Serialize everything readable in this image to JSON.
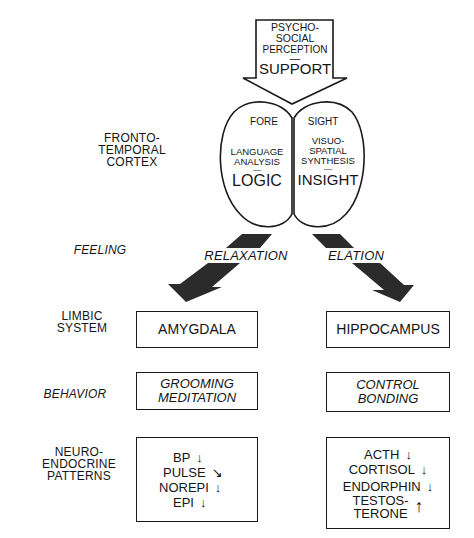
{
  "input_arrow": {
    "lines": [
      "PSYCHO-",
      "SOCIAL",
      "PERCEPTION",
      "—",
      "SUPPORT"
    ]
  },
  "cortex": {
    "level_label": [
      "FRONTO-",
      "TEMPORAL",
      "CORTEX"
    ],
    "left_lobe": {
      "header": "FORE",
      "function": [
        "LANGUAGE",
        "ANALYSIS"
      ],
      "dash": "—",
      "mode": "LOGIC"
    },
    "right_lobe": {
      "header": "SIGHT",
      "function": [
        "VISUO-",
        "SPATIAL",
        "SYNTHESIS"
      ],
      "dash": "—",
      "mode": "INSIGHT"
    }
  },
  "feeling": {
    "level_label": "FEELING",
    "left": "RELAXATION",
    "right": "ELATION"
  },
  "limbic": {
    "level_label": [
      "LIMBIC",
      "SYSTEM"
    ],
    "left": "AMYGDALA",
    "right": "HIPPOCAMPUS"
  },
  "behavior": {
    "level_label": "BEHAVIOR",
    "left": [
      "GROOMING",
      "MEDITATION"
    ],
    "right": [
      "CONTROL",
      "BONDING"
    ]
  },
  "neuroendocrine": {
    "level_label": [
      "NEURO-",
      "ENDOCRINE",
      "PATTERNS"
    ],
    "left": [
      {
        "name": "BP",
        "direction": "down",
        "glyph": "↓"
      },
      {
        "name": "PULSE",
        "direction": "down-right",
        "glyph": "↘"
      },
      {
        "name": "NOREPI",
        "direction": "down",
        "glyph": "↓"
      },
      {
        "name": "EPI",
        "direction": "down",
        "glyph": "↓"
      }
    ],
    "right": [
      {
        "name": "ACTH",
        "direction": "down",
        "glyph": "↓"
      },
      {
        "name": "CORTISOL",
        "direction": "down",
        "glyph": "↓"
      },
      {
        "name": "ENDORPHIN",
        "direction": "down",
        "glyph": "↓"
      },
      {
        "name": "TESTOS-",
        "name2": "TERONE",
        "direction": "up",
        "glyph": "↑"
      }
    ]
  },
  "colors": {
    "ink": "#151515",
    "arrow_fill": "#2b2b2b",
    "background": "#ffffff"
  }
}
